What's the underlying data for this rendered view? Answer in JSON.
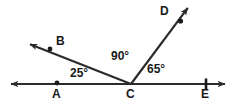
{
  "diagram": {
    "type": "geometry-angle-diagram",
    "background_color": "#ffffff",
    "stroke_color": "#2b2b2b",
    "text_color": "#1a1a1a",
    "canvas": {
      "width": 235,
      "height": 105
    },
    "points": [
      {
        "name": "A",
        "label": "A",
        "x": 57,
        "y": 84,
        "label_x": 53,
        "label_y": 90,
        "marker": "dot"
      },
      {
        "name": "B",
        "label": "B",
        "x": 50,
        "y": 49,
        "label_x": 55,
        "label_y": 37,
        "marker": "dot"
      },
      {
        "name": "C",
        "label": "C",
        "x": 131,
        "y": 84,
        "label_x": 127,
        "label_y": 90,
        "marker": "vertex"
      },
      {
        "name": "D",
        "label": "D",
        "x": 180,
        "y": 21,
        "label_x": 160,
        "label_y": 7,
        "marker": "dot"
      },
      {
        "name": "E",
        "label": "E",
        "x": 206,
        "y": 84,
        "label_x": 202,
        "label_y": 90,
        "marker": "tick"
      }
    ],
    "lines": [
      {
        "name": "line-AE",
        "kind": "double-arrow-line",
        "x1": 8,
        "y1": 84,
        "x2": 228,
        "y2": 84
      },
      {
        "name": "ray-CB",
        "kind": "single-arrow-ray",
        "x1": 131,
        "y1": 84,
        "x2": 27,
        "y2": 43
      },
      {
        "name": "ray-CD",
        "kind": "single-arrow-ray",
        "x1": 131,
        "y1": 84,
        "x2": 190,
        "y2": 5
      }
    ],
    "angles": [
      {
        "name": "angle-ACB",
        "value": "25°",
        "label_x": 70,
        "label_y": 67,
        "vertex": "C",
        "rays": [
          "CA",
          "CB"
        ]
      },
      {
        "name": "angle-BCD",
        "value": "90°",
        "label_x": 111,
        "label_y": 50,
        "vertex": "C",
        "rays": [
          "CB",
          "CD"
        ]
      },
      {
        "name": "angle-DCE",
        "value": "65°",
        "label_x": 147,
        "label_y": 63,
        "vertex": "C",
        "rays": [
          "CD",
          "CE"
        ]
      }
    ]
  }
}
